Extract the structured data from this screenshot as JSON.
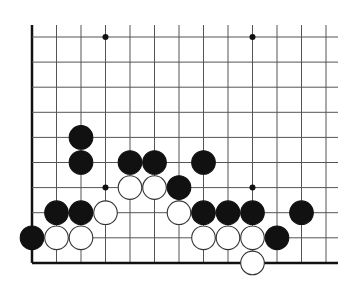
{
  "diagram": {
    "type": "go-board-fragment",
    "columns": 13,
    "rows": 10,
    "origin": {
      "x": 32,
      "y": 37
    },
    "spacing_x": 24.5,
    "spacing_y": 25.1,
    "top_overhang": 12,
    "right_overhang": 12,
    "edges": {
      "left": true,
      "bottom": true,
      "top": false,
      "right": false
    },
    "stone_radius": 11.8,
    "colors": {
      "line": "#555555",
      "edge": "#111111",
      "black_stone": "#111111",
      "white_stone": "#ffffff",
      "white_stroke": "#333333",
      "background": "#ffffff"
    },
    "star_points": [
      {
        "col": 3,
        "row": 0
      },
      {
        "col": 9,
        "row": 0
      },
      {
        "col": 3,
        "row": 6
      },
      {
        "col": 9,
        "row": 6
      }
    ],
    "stones": [
      {
        "color": "black",
        "col": 2,
        "row": 4
      },
      {
        "color": "black",
        "col": 2,
        "row": 5
      },
      {
        "color": "black",
        "col": 4,
        "row": 5
      },
      {
        "color": "black",
        "col": 5,
        "row": 5
      },
      {
        "color": "black",
        "col": 7,
        "row": 5
      },
      {
        "color": "white",
        "col": 4,
        "row": 6
      },
      {
        "color": "white",
        "col": 5,
        "row": 6
      },
      {
        "color": "black",
        "col": 6,
        "row": 6
      },
      {
        "color": "black",
        "col": 1,
        "row": 7
      },
      {
        "color": "black",
        "col": 2,
        "row": 7
      },
      {
        "color": "white",
        "col": 3,
        "row": 7
      },
      {
        "color": "white",
        "col": 6,
        "row": 7
      },
      {
        "color": "black",
        "col": 7,
        "row": 7
      },
      {
        "color": "black",
        "col": 8,
        "row": 7
      },
      {
        "color": "black",
        "col": 9,
        "row": 7
      },
      {
        "color": "black",
        "col": 11,
        "row": 7
      },
      {
        "color": "black",
        "col": 0,
        "row": 8
      },
      {
        "color": "white",
        "col": 1,
        "row": 8
      },
      {
        "color": "white",
        "col": 2,
        "row": 8
      },
      {
        "color": "white",
        "col": 7,
        "row": 8
      },
      {
        "color": "white",
        "col": 8,
        "row": 8
      },
      {
        "color": "white",
        "col": 9,
        "row": 8
      },
      {
        "color": "black",
        "col": 10,
        "row": 8
      },
      {
        "color": "white",
        "col": 9,
        "row": 9
      }
    ]
  }
}
